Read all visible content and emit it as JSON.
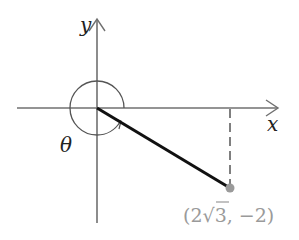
{
  "diagram": {
    "axes": {
      "x_label": "x",
      "y_label": "y",
      "color": "#707070"
    },
    "angle": {
      "label": "θ",
      "arc_color": "#555555"
    },
    "terminal_side": {
      "color": "#111111"
    },
    "point": {
      "label": "(2√3, −2)",
      "label_parts": {
        "open": "(2",
        "radical": "√",
        "radicand": "3",
        "rest": ", −2)"
      },
      "color": "#9a9a9a",
      "x": "2√3",
      "y": "-2"
    },
    "dashed_line": {
      "color": "#555555"
    }
  }
}
